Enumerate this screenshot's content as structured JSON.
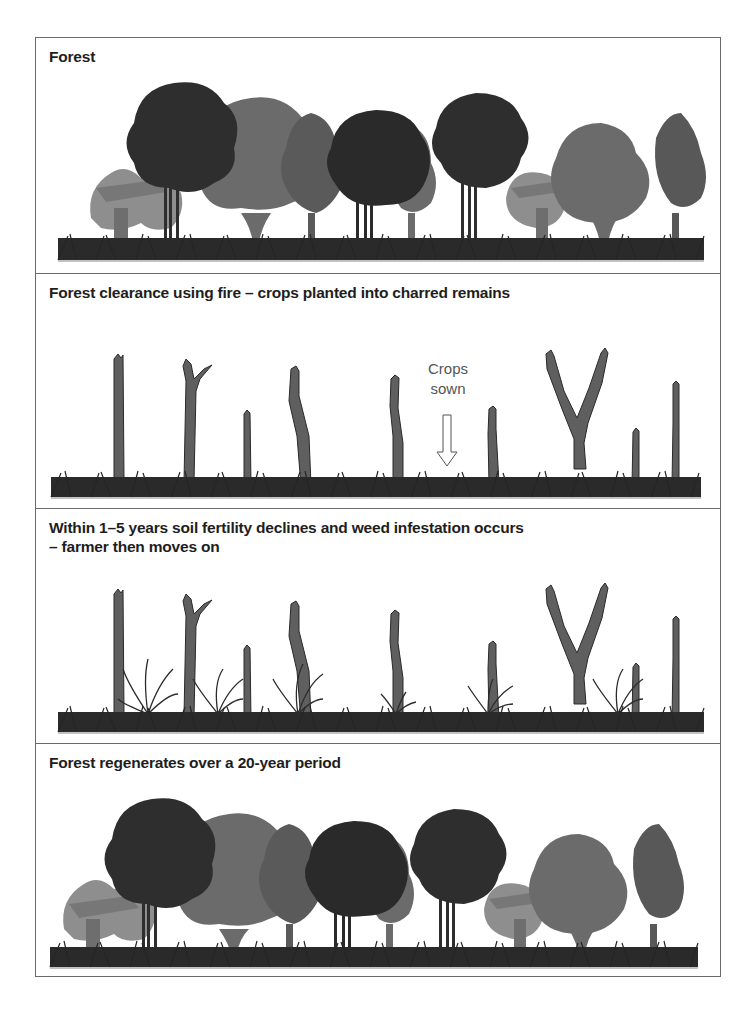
{
  "panels": [
    {
      "id": "forest",
      "title": "Forest",
      "scene": "mature-forest"
    },
    {
      "id": "clearance",
      "title": "Forest clearance using fire – crops planted into charred remains",
      "scene": "charred-stumps",
      "annotation": {
        "line1": "Crops",
        "line2": "sown",
        "icon": "down-arrow-icon"
      }
    },
    {
      "id": "decline",
      "title": "Within 1–5 years soil fertility declines and weed infestation occurs\n – farmer then moves on",
      "scene": "stumps-with-weeds"
    },
    {
      "id": "regeneration",
      "title": "Forest regenerates over a 20-year period",
      "scene": "regenerated-forest"
    }
  ],
  "colors": {
    "dark_tree": "#2e2e2e",
    "mid_tree": "#6b6b6b",
    "light_tree": "#8a8a8a",
    "stump": "#5f5f5f",
    "grass": "#262626",
    "border": "#6a6a6a"
  }
}
